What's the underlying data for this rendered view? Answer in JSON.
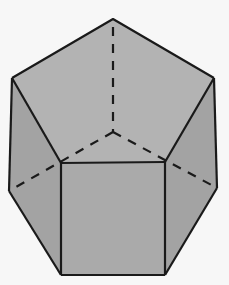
{
  "figure": {
    "background": "#f7f7f7",
    "face_colors": {
      "top": "#b4b4b4",
      "front": "#ababab",
      "left": "#a2a2a2",
      "right": "#a2a2a2"
    },
    "edge_color": "#1a1a1a",
    "vertices": {
      "apex": [
        113,
        19
      ],
      "top_left": [
        12,
        78
      ],
      "top_right": [
        214,
        78
      ],
      "front_top_left": [
        61,
        163
      ],
      "front_top_right": [
        165,
        162
      ],
      "hidden_center": [
        113,
        132
      ],
      "left_low": [
        9,
        191
      ],
      "right_low": [
        217,
        188
      ],
      "front_bottom_left": [
        61,
        275
      ],
      "front_bottom_right": [
        165,
        275
      ]
    },
    "solid_edges": 14,
    "hidden_edges": 3
  }
}
